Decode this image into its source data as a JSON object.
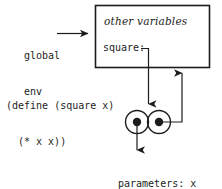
{
  "diagram": {
    "colors": {
      "ink": "#1c1c1c",
      "background": "#ffffff"
    },
    "global_env": {
      "label_line1": "global",
      "label_line2": "env",
      "arrow_name": "global-env-pointer-arrow"
    },
    "environment_frame": {
      "other_variables_label": "other variables",
      "binding_label": "square:"
    },
    "source_code": {
      "line1": "(define (square x)",
      "line2": "(* x x))"
    },
    "procedure_object": {
      "left_cell_name": "parameters-body-pointer",
      "right_cell_name": "environment-pointer",
      "parameters_label": "parameters: x",
      "body_label": "body: (* x x)"
    }
  }
}
